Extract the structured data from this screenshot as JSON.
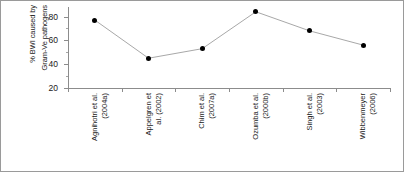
{
  "chart_data": {
    "type": "line",
    "title": "",
    "xlabel": "",
    "ylabel_line1": "% BWI caused by",
    "ylabel_line2": "Gram-Ve pathogens",
    "categories": [
      "Agnihotri et al. (2004a)",
      "Appelgren et al. (2002)",
      "Chim et al. (2007a)",
      "Ozumba et al. (2000b)",
      "Singh et al. (2003)",
      "Wibbenmeyer (2006)"
    ],
    "category_lines": [
      [
        "Agnihotri et al.",
        "(2004a)"
      ],
      [
        "Appelgren et",
        "al. (2002)"
      ],
      [
        "Chim et al.",
        "(2007a)"
      ],
      [
        "Ozumba et al.",
        "(2000b)"
      ],
      [
        "Singh et al.",
        "(2003)"
      ],
      [
        "Wibbenmeyer",
        "(2006)"
      ]
    ],
    "values": [
      77,
      45,
      53,
      84,
      68,
      56
    ],
    "ylim": [
      20,
      88
    ],
    "yticks": [
      20,
      40,
      60,
      80
    ],
    "ytick_labels": [
      "20",
      "40",
      "60",
      "80"
    ],
    "grid": false,
    "legend": false,
    "marker": "filled-circle",
    "marker_color": "#000000",
    "line_color": "#a8a8a8",
    "axis_color": "#8c8c8c",
    "border_color": "#9a9a9a"
  }
}
